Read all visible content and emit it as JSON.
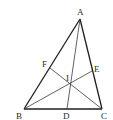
{
  "diagram": {
    "type": "triangle-with-cevians",
    "points": {
      "A": {
        "label": "A",
        "x": 80,
        "y": 19,
        "lx": 77,
        "ly": 15
      },
      "B": {
        "label": "B",
        "x": 24,
        "y": 109,
        "lx": 16,
        "ly": 119
      },
      "C": {
        "label": "C",
        "x": 102,
        "y": 109,
        "lx": 101,
        "ly": 119
      },
      "D": {
        "label": "D",
        "x": 67,
        "y": 109,
        "lx": 63,
        "ly": 119
      },
      "E": {
        "label": "E",
        "x": 92,
        "y": 71,
        "lx": 94,
        "ly": 72
      },
      "F": {
        "label": "F",
        "x": 50,
        "y": 68,
        "lx": 42,
        "ly": 67
      },
      "I": {
        "label": "I",
        "x": 69,
        "y": 84,
        "lx": 66,
        "ly": 81
      }
    },
    "sides": [
      [
        "A",
        "B"
      ],
      [
        "B",
        "C"
      ],
      [
        "C",
        "A"
      ]
    ],
    "cevians": [
      [
        "A",
        "D"
      ],
      [
        "B",
        "E"
      ],
      [
        "C",
        "F"
      ]
    ],
    "colors": {
      "line": "#1e1e1e",
      "text": "#2a2a2a",
      "background": "#ffffff"
    }
  }
}
